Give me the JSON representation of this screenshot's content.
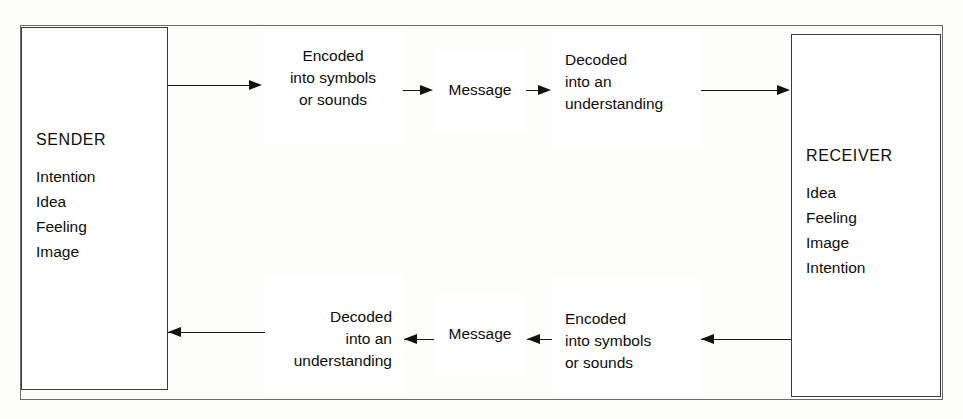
{
  "figure": {
    "type": "process-flow-diagram"
  },
  "parties": {
    "sender": {
      "title": "SENDER",
      "attributes": [
        "Intention",
        "Idea",
        "Feeling",
        "Image"
      ]
    },
    "receiver": {
      "title": "RECEIVER",
      "attributes": [
        "Idea",
        "Feeling",
        "Image",
        "Intention"
      ]
    }
  },
  "forward_path": {
    "direction": "left-to-right",
    "steps": [
      {
        "id": "encode-top",
        "label": "Encoded\ninto symbols\nor sounds",
        "align": "center"
      },
      {
        "id": "message-top",
        "label": "Message",
        "align": "center"
      },
      {
        "id": "decode-top",
        "label": "Decoded\ninto an\nunderstanding",
        "align": "left"
      }
    ]
  },
  "feedback_path": {
    "direction": "right-to-left",
    "steps": [
      {
        "id": "decode-bottom",
        "label": "Decoded\ninto an\nunderstanding",
        "align": "right"
      },
      {
        "id": "message-bottom",
        "label": "Message",
        "align": "center"
      },
      {
        "id": "encode-bottom",
        "label": "Encoded\ninto symbols\nor sounds",
        "align": "left"
      }
    ]
  },
  "colors": {
    "background": "#fdfdfb",
    "box_border": "#3a3a3a",
    "frame_border": "#6b6b6b",
    "connector": "#1a1a1a",
    "text": "#0d0d0d"
  }
}
